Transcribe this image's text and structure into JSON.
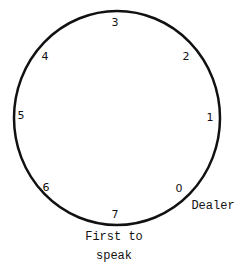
{
  "diagram": {
    "type": "seating-circle",
    "seats": [
      {
        "id": "0",
        "label": "0",
        "x": 179,
        "y": 188
      },
      {
        "id": "1",
        "label": "1",
        "x": 210,
        "y": 117
      },
      {
        "id": "2",
        "label": "2",
        "x": 186,
        "y": 56
      },
      {
        "id": "3",
        "label": "3",
        "x": 115,
        "y": 22
      },
      {
        "id": "4",
        "label": "4",
        "x": 45,
        "y": 56
      },
      {
        "id": "5",
        "label": "5",
        "x": 21,
        "y": 115
      },
      {
        "id": "6",
        "label": "6",
        "x": 46,
        "y": 187
      },
      {
        "id": "7",
        "label": "7",
        "x": 115,
        "y": 214
      }
    ],
    "annotations": {
      "dealer": "Dealer",
      "first_line1": "First to",
      "first_line2": "speak"
    }
  }
}
